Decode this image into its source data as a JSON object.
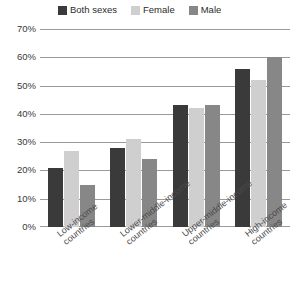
{
  "chart_data": {
    "type": "bar",
    "title": "",
    "xlabel": "",
    "ylabel": "",
    "ylim": [
      0,
      70
    ],
    "ytick_labels": [
      "70%",
      "60%",
      "50%",
      "40%",
      "30%",
      "20%",
      "10%",
      "0%"
    ],
    "ytick_values": [
      70,
      60,
      50,
      40,
      30,
      20,
      10,
      0
    ],
    "grid": true,
    "legend_position": "top",
    "categories": [
      "Low-income countries",
      "Lower-middle-income countries",
      "Upper-middle-income countries",
      "High-income countries"
    ],
    "category_lines": [
      [
        "Low-income",
        "countries"
      ],
      [
        "Lower-middle-income",
        "countries"
      ],
      [
        "Upper-middle-income",
        "countries"
      ],
      [
        "High-income",
        "countries"
      ]
    ],
    "series": [
      {
        "name": "Both sexes",
        "color": "#3a3a3a",
        "values": [
          21,
          28,
          43,
          56
        ]
      },
      {
        "name": "Female",
        "color": "#cfcfcf",
        "values": [
          27,
          31,
          42,
          52
        ]
      },
      {
        "name": "Male",
        "color": "#878787",
        "values": [
          15,
          24,
          43,
          60
        ]
      }
    ]
  },
  "legend": {
    "items": [
      {
        "label": "Both sexes",
        "color": "#3a3a3a"
      },
      {
        "label": "Female",
        "color": "#cfcfcf"
      },
      {
        "label": "Male",
        "color": "#878787"
      }
    ]
  },
  "axis": {
    "y_ticks": [
      {
        "label": "70%",
        "value": 70
      },
      {
        "label": "60%",
        "value": 60
      },
      {
        "label": "50%",
        "value": 50
      },
      {
        "label": "40%",
        "value": 40
      },
      {
        "label": "30%",
        "value": 30
      },
      {
        "label": "20%",
        "value": 20
      },
      {
        "label": "10%",
        "value": 10
      },
      {
        "label": "0%",
        "value": 0
      }
    ]
  },
  "colors": {
    "grid": "#9a9a9a",
    "text": "#3a3a3a",
    "background": "#ffffff"
  }
}
